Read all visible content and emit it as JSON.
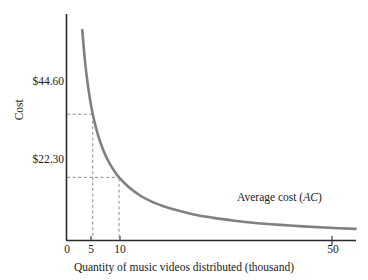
{
  "chart_data": {
    "type": "line",
    "title": "",
    "xlabel": "Quantity of music videos distributed (thousand)",
    "ylabel": "Cost",
    "xlim": [
      0,
      55
    ],
    "ylim": [
      0,
      80
    ],
    "grid": false,
    "legend_position": "inline-right",
    "x_ticks": [
      "0",
      "5",
      "10",
      "50"
    ],
    "x_tick_values": [
      0,
      5,
      10,
      50
    ],
    "y_ticks": [
      "$44.60",
      "$22.30"
    ],
    "y_tick_values": [
      44.6,
      22.3
    ],
    "series": [
      {
        "name": "Average cost (AC)",
        "name_plain": "Average cost",
        "name_symbol": "AC",
        "color": "#808080",
        "x": [
          3,
          3.5,
          4,
          4.5,
          5,
          6,
          7,
          8,
          9,
          10,
          12,
          14,
          16,
          18,
          20,
          24,
          28,
          32,
          36,
          40,
          45,
          50,
          55
        ],
        "y": [
          74.3,
          63.7,
          55.8,
          49.6,
          44.6,
          37.2,
          31.9,
          27.9,
          24.8,
          22.3,
          18.6,
          15.9,
          13.9,
          12.4,
          11.2,
          9.3,
          8.0,
          7.0,
          6.2,
          5.6,
          5.0,
          4.5,
          4.1
        ]
      }
    ],
    "annotations": [
      {
        "label": "$44.60",
        "x": 5,
        "y": 44.6,
        "guides": [
          "horizontal-dashed-to-axis",
          "vertical-dashed-to-axis"
        ]
      },
      {
        "label": "$22.30",
        "x": 10,
        "y": 22.3,
        "guides": [
          "horizontal-dashed-to-axis",
          "vertical-dashed-to-axis"
        ]
      }
    ]
  },
  "axes": {
    "y_title": "Cost",
    "x_title": "Quantity of music videos distributed (thousand)",
    "y_tick_high": "$44.60",
    "y_tick_low": "$22.30",
    "x_tick_0": "0",
    "x_tick_5": "5",
    "x_tick_10": "10",
    "x_tick_50": "50"
  },
  "curve": {
    "label_text": "Average cost (",
    "label_symbol": "AC",
    "label_close": ")"
  },
  "colors": {
    "curve": "#808080",
    "axis": "#2b2b2b",
    "dashed_guide": "#9a9a9a",
    "text": "#1a1a1a",
    "background": "#ffffff"
  }
}
